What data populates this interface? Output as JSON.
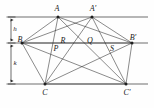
{
  "figure": {
    "type": "geometry-diagram",
    "canvas": {
      "width": 154,
      "height": 108
    },
    "colors": {
      "stroke": "#2b2b2b",
      "guide": "#6f6f6f",
      "background": "#fefefe",
      "label": "#1a1a1a"
    },
    "parallel_lines": [
      {
        "name": "top-line",
        "y": 17,
        "x1": 8,
        "x2": 148
      },
      {
        "name": "middle-line",
        "y": 43,
        "x1": 8,
        "x2": 148
      },
      {
        "name": "bottom-line",
        "y": 84,
        "x1": 8,
        "x2": 148
      }
    ],
    "dimension_axis": {
      "x": 11,
      "y_top": 17,
      "y_mid": 43,
      "y_bottom": 84
    },
    "dimensions": [
      {
        "label": "h",
        "from": "top-line",
        "to": "middle-line",
        "label_x": 15,
        "label_y": 29
      },
      {
        "label": "k",
        "from": "middle-line",
        "to": "bottom-line",
        "label_x": 15,
        "label_y": 63
      }
    ],
    "vertices": [
      {
        "label": "A",
        "x": 58,
        "y": 17,
        "label_x": 57,
        "label_y": 9,
        "on": "top-line"
      },
      {
        "label": "A'",
        "x": 92,
        "y": 17,
        "label_x": 93,
        "label_y": 9,
        "on": "top-line"
      },
      {
        "label": "B",
        "x": 22,
        "y": 43,
        "label_x": 20,
        "label_y": 40,
        "on": "middle-line"
      },
      {
        "label": "B'",
        "x": 132,
        "y": 43,
        "label_x": 133,
        "label_y": 38,
        "on": "middle-line"
      },
      {
        "label": "C",
        "x": 45,
        "y": 84,
        "label_x": 45,
        "label_y": 93,
        "on": "bottom-line"
      },
      {
        "label": "C'",
        "x": 126,
        "y": 84,
        "label_x": 127,
        "label_y": 93,
        "on": "bottom-line"
      }
    ],
    "intersection_points": [
      {
        "label": "P",
        "x": 56,
        "y": 49
      },
      {
        "label": "R",
        "x": 63,
        "y": 41
      },
      {
        "label": "Q",
        "x": 90,
        "y": 41
      },
      {
        "label": "S",
        "x": 112,
        "y": 49
      }
    ],
    "segments": [
      {
        "name": "A-B",
        "x1": 58,
        "y1": 17,
        "x2": 22,
        "y2": 43
      },
      {
        "name": "A-C",
        "x1": 58,
        "y1": 17,
        "x2": 45,
        "y2": 84
      },
      {
        "name": "A-B'",
        "x1": 58,
        "y1": 17,
        "x2": 132,
        "y2": 43
      },
      {
        "name": "A-C'",
        "x1": 58,
        "y1": 17,
        "x2": 126,
        "y2": 84
      },
      {
        "name": "A'-B",
        "x1": 92,
        "y1": 17,
        "x2": 22,
        "y2": 43
      },
      {
        "name": "A'-C",
        "x1": 92,
        "y1": 17,
        "x2": 45,
        "y2": 84
      },
      {
        "name": "A'-B'",
        "x1": 92,
        "y1": 17,
        "x2": 132,
        "y2": 43
      },
      {
        "name": "A'-C'",
        "x1": 92,
        "y1": 17,
        "x2": 126,
        "y2": 84
      },
      {
        "name": "B-C",
        "x1": 22,
        "y1": 43,
        "x2": 45,
        "y2": 84
      },
      {
        "name": "B-C'",
        "x1": 22,
        "y1": 43,
        "x2": 126,
        "y2": 84
      },
      {
        "name": "B'-C",
        "x1": 132,
        "y1": 43,
        "x2": 45,
        "y2": 84
      },
      {
        "name": "B'-C'",
        "x1": 132,
        "y1": 43,
        "x2": 126,
        "y2": 84
      },
      {
        "name": "B-B'",
        "x1": 22,
        "y1": 43,
        "x2": 132,
        "y2": 43
      },
      {
        "name": "C-C'",
        "x1": 45,
        "y1": 84,
        "x2": 126,
        "y2": 84
      }
    ]
  }
}
